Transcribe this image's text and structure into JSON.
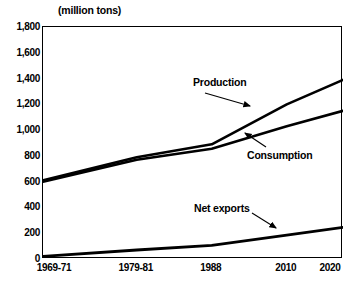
{
  "chart_data": {
    "type": "line",
    "title": "(million tons)",
    "xlabel": "",
    "ylabel": "",
    "categories": [
      "1969-71",
      "1979-81",
      "1988",
      "2010",
      "2020"
    ],
    "x_positions": [
      0,
      0.3125,
      0.5625,
      0.8125,
      1.0
    ],
    "ylim": [
      0,
      1800
    ],
    "ytick_values": [
      0,
      200,
      400,
      600,
      800,
      1000,
      1200,
      1400,
      1600,
      1800
    ],
    "ytick_labels": [
      "0",
      "200",
      "400",
      "600",
      "800",
      "1,000",
      "1,200",
      "1,400",
      "1,600",
      "1,800"
    ],
    "grid": false,
    "legend": "annotations-with-arrows",
    "series": [
      {
        "name": "Production",
        "values": [
          610,
          790,
          890,
          1200,
          1390
        ],
        "label": "Production",
        "color": "#000000"
      },
      {
        "name": "Consumption",
        "values": [
          600,
          770,
          855,
          1030,
          1150
        ],
        "label": "Consumption",
        "color": "#000000"
      },
      {
        "name": "Net exports",
        "values": [
          20,
          70,
          105,
          185,
          245
        ],
        "label": "Net exports",
        "color": "#000000"
      }
    ],
    "annotations": [
      {
        "text": "Production",
        "target_series": "Production",
        "arrow": "down-right"
      },
      {
        "text": "Consumption",
        "target_series": "Consumption",
        "arrow": "up-left"
      },
      {
        "text": "Net exports",
        "target_series": "Net exports",
        "arrow": "down-right"
      }
    ]
  },
  "colors": {
    "line": "#000000",
    "frame": "#000000",
    "background": "#ffffff"
  }
}
